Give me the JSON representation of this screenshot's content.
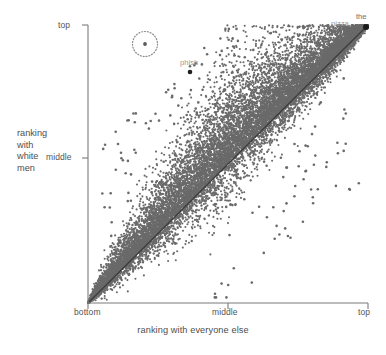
{
  "figure": {
    "background": "#ffffff",
    "point_color": "#6a6a6a",
    "axis_color": "#777777",
    "diagonal_color": "#3a3a3a",
    "text_color": "#4e4e4e"
  },
  "axes": {
    "x": {
      "title": "ranking with everyone else",
      "ticks": [
        {
          "key": "bottom",
          "label": "bottom"
        },
        {
          "key": "middle",
          "label": "middle"
        },
        {
          "key": "top",
          "label": "top"
        }
      ]
    },
    "y": {
      "title_lines": [
        "ranking",
        "with",
        "white",
        "men"
      ],
      "ticks": [
        {
          "key": "middle",
          "label": "middle"
        },
        {
          "key": "top",
          "label": "top"
        }
      ]
    }
  },
  "annotations": [
    {
      "name": "the",
      "label": "the",
      "color": "#6d6d6d",
      "x_frac": 0.975,
      "y_frac": 0.985
    },
    {
      "name": "pizza",
      "label": "pizza",
      "color": "#9a9a9a",
      "x_frac": 0.905,
      "y_frac": 0.96
    },
    {
      "name": "phish",
      "label": "phish",
      "color": "#9a9a9a",
      "x_frac": 0.365,
      "y_frac": 0.838
    },
    {
      "name": "highlighted-outlier",
      "label": "",
      "color": "#8a8a8a",
      "x_frac": 0.205,
      "y_frac": 0.932
    }
  ],
  "chart_data": {
    "type": "scatter",
    "title": "",
    "xlabel": "ranking with everyone else",
    "ylabel": "ranking with white men",
    "xlim": [
      0,
      1
    ],
    "ylim": [
      0,
      1
    ],
    "xticks": [
      0,
      0.5,
      1
    ],
    "xticklabels": [
      "bottom",
      "middle",
      "top"
    ],
    "yticks": [
      0.5,
      1
    ],
    "yticklabels": [
      "middle",
      "top"
    ],
    "grid": false,
    "legend": null,
    "reference_line": {
      "type": "identity",
      "from": [
        0,
        0
      ],
      "to": [
        1,
        1
      ],
      "color": "#3a3a3a"
    },
    "point_color": "#6a6a6a",
    "point_size_px": 2.1,
    "approx_point_count": 9000,
    "labeled_points": [
      {
        "label": "the",
        "x": 1.0,
        "y": 1.0
      },
      {
        "label": "pizza",
        "x": 0.975,
        "y": 0.985
      },
      {
        "label": "phish",
        "x": 0.37,
        "y": 0.82
      },
      {
        "label": "",
        "x": 0.205,
        "y": 0.932,
        "marker": "circled-outlier"
      }
    ],
    "distribution": {
      "shape": "asymmetric-fan-above-diagonal",
      "densest_band": "just above the identity line between x=0.05 and x=0.6",
      "sparse_region": "below the identity line at high x / low y"
    }
  }
}
